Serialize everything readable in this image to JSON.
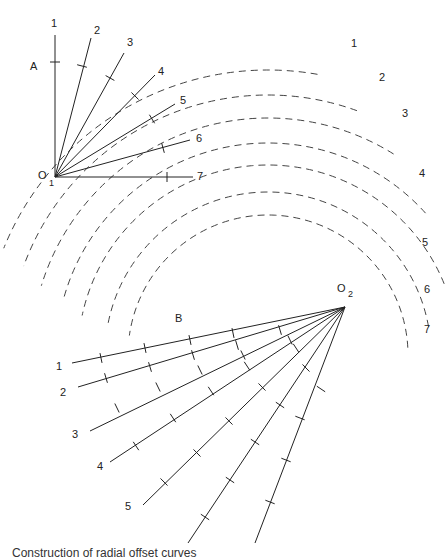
{
  "diagram": {
    "point_a_label": "A",
    "point_b_label": "B",
    "origin1": {
      "label": "O",
      "sub": "1",
      "x": 55,
      "y": 177
    },
    "origin2": {
      "label": "O",
      "sub": "2",
      "x": 345,
      "y": 307
    },
    "fan1": {
      "rays": [
        {
          "label": "1",
          "end": [
            55,
            35
          ],
          "label_pos": [
            51,
            27
          ],
          "ticks": [
            [
              55,
              62
            ]
          ]
        },
        {
          "label": "2",
          "end": [
            91,
            38
          ],
          "label_pos": [
            94,
            34
          ],
          "ticks": [
            [
              82,
              66
            ]
          ]
        },
        {
          "label": "3",
          "end": [
            124,
            53
          ],
          "label_pos": [
            127,
            46
          ],
          "ticks": [
            [
              110,
              78
            ]
          ]
        },
        {
          "label": "4",
          "end": [
            155,
            75
          ],
          "label_pos": [
            158,
            75
          ],
          "ticks": [
            [
              135,
              96
            ]
          ]
        },
        {
          "label": "5",
          "end": [
            175,
            104
          ],
          "label_pos": [
            180,
            104
          ],
          "ticks": [
            [
              152,
              119
            ]
          ]
        },
        {
          "label": "6",
          "end": [
            190,
            140
          ],
          "label_pos": [
            196,
            142
          ],
          "ticks": [
            [
              163,
              148
            ]
          ]
        },
        {
          "label": "7",
          "end": [
            193,
            177
          ],
          "label_pos": [
            197,
            180
          ],
          "ticks": [
            [
              167,
              177
            ]
          ]
        }
      ]
    },
    "fan2": {
      "rays": [
        {
          "label": "1",
          "end": [
            72,
            363
          ],
          "label_pos": [
            56,
            370
          ],
          "ticks": [
            [
              101,
              358
            ],
            [
              145,
              348
            ],
            [
              190,
              340
            ],
            [
              233,
              333
            ]
          ]
        },
        {
          "label": "2",
          "end": [
            78,
            387
          ],
          "label_pos": [
            60,
            396
          ],
          "ticks": [
            [
              106,
              378
            ],
            [
              150,
              367
            ],
            [
              193,
              355
            ],
            [
              237,
              345
            ],
            [
              280,
              330
            ]
          ]
        },
        {
          "label": "3",
          "end": [
            90,
            431
          ],
          "label_pos": [
            72,
            438
          ],
          "ticks": [
            [
              117,
              408
            ],
            [
              158,
              387
            ],
            [
              200,
              370
            ],
            [
              243,
              355
            ],
            [
              290,
              340
            ]
          ]
        },
        {
          "label": "4",
          "end": [
            110,
            462
          ],
          "label_pos": [
            97,
            470
          ],
          "ticks": [
            [
              136,
              446
            ],
            [
              173,
              418
            ],
            [
              211,
              391
            ],
            [
              247,
              366
            ],
            [
              296,
              348
            ]
          ]
        },
        {
          "label": "5",
          "end": [
            143,
            505
          ],
          "label_pos": [
            125,
            510
          ],
          "ticks": [
            [
              164,
              482
            ],
            [
              197,
              453
            ],
            [
              229,
              421
            ],
            [
              262,
              387
            ],
            [
              306,
              368
            ]
          ]
        },
        {
          "label": "6",
          "end": [
            188,
            543
          ],
          "label_pos": null,
          "ticks": [
            [
              205,
              517
            ],
            [
              230,
              480
            ],
            [
              255,
              442
            ],
            [
              280,
              405
            ],
            [
              321,
              389
            ]
          ]
        },
        {
          "label": "7",
          "end": [
            255,
            543
          ],
          "label_pos": null,
          "ticks": [
            [
              270,
              502
            ],
            [
              286,
              460
            ],
            [
              300,
              418
            ]
          ]
        }
      ]
    },
    "arcs": [
      {
        "label": "1",
        "label_pos": [
          351,
          47
        ],
        "r": 285,
        "a0": -80,
        "a1": -158
      },
      {
        "label": "2",
        "label_pos": [
          379,
          81
        ],
        "r": 260,
        "a0": -70,
        "a1": -160
      },
      {
        "label": "3",
        "label_pos": [
          402,
          117
        ],
        "r": 237,
        "a0": -58,
        "a1": -163
      },
      {
        "label": "4",
        "label_pos": [
          419,
          177
        ],
        "r": 212,
        "a0": -42,
        "a1": -165
      },
      {
        "label": "5",
        "label_pos": [
          422,
          246
        ],
        "r": 190,
        "a0": -22,
        "a1": -168
      },
      {
        "label": "6",
        "label_pos": [
          424,
          293
        ],
        "r": 163,
        "a0": -10,
        "a1": -170
      },
      {
        "label": "7",
        "label_pos": [
          424,
          333
        ],
        "r": 140,
        "a0": -3,
        "a1": -172
      }
    ],
    "arc_center": [
      268,
      355
    ],
    "caption": "Construction of radial offset curves"
  }
}
